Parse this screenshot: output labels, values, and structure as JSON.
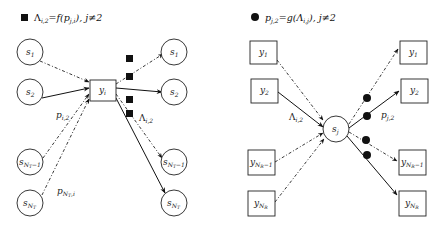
{
  "left_panel": {
    "legend": {
      "marker": "filled-square",
      "text": "Λ",
      "text_sub": "i,2",
      "text_rest": "=f(p",
      "text_sub2": "j,i",
      "text_tail": "), j≠2"
    },
    "center_node": {
      "label": "y",
      "sub": "i",
      "shape": "square"
    },
    "left_nodes": [
      {
        "label": "s",
        "sub": "1",
        "edge": "dash-dot"
      },
      {
        "label": "s",
        "sub": "2",
        "edge": "solid"
      },
      {
        "label": "s",
        "sub": "N",
        "sub2": "T",
        "sub3": "−1",
        "edge": "dash-dot"
      },
      {
        "label": "s",
        "sub": "N",
        "sub2": "T",
        "edge": "dash-dot"
      }
    ],
    "right_nodes": [
      {
        "label": "s",
        "sub": "1",
        "edge": "dash-dot"
      },
      {
        "label": "s",
        "sub": "2",
        "edge": "solid"
      },
      {
        "label": "s",
        "sub": "N",
        "sub2": "T",
        "sub3": "−1",
        "edge": "dash-dot"
      },
      {
        "label": "s",
        "sub": "N",
        "sub2": "T",
        "edge": "solid"
      }
    ],
    "edge_labels": {
      "in_top": {
        "main": "p",
        "sub": "i,2"
      },
      "in_bottom": {
        "main": "p",
        "sub": "N",
        "sub2": "T",
        "sub3": ",i"
      },
      "out": {
        "main": "Λ",
        "sub": "i,2"
      }
    }
  },
  "right_panel": {
    "legend": {
      "marker": "filled-circle",
      "text": "p",
      "text_sub": "j,2",
      "text_rest": "=g(Λ",
      "text_sub2": "i,j",
      "text_tail": "), j≠2"
    },
    "center_node": {
      "label": "s",
      "sub": "j",
      "shape": "circle"
    },
    "left_nodes": [
      {
        "label": "y",
        "sub": "1",
        "edge": "dash-dot"
      },
      {
        "label": "y",
        "sub": "2",
        "edge": "solid"
      },
      {
        "label": "y",
        "sub": "N",
        "sub2": "R",
        "sub3": "−1",
        "edge": "dash-dot"
      },
      {
        "label": "y",
        "sub": "N",
        "sub2": "R",
        "edge": "dash-dot"
      }
    ],
    "right_nodes": [
      {
        "label": "y",
        "sub": "1",
        "edge": "dash-dot"
      },
      {
        "label": "y",
        "sub": "2",
        "edge": "solid"
      },
      {
        "label": "y",
        "sub": "N",
        "sub2": "R",
        "sub3": "−1",
        "edge": "dash-dot"
      },
      {
        "label": "y",
        "sub": "N",
        "sub2": "R",
        "edge": "solid"
      }
    ],
    "edge_labels": {
      "in": {
        "main": "Λ",
        "sub": "i,2"
      },
      "out": {
        "main": "p",
        "sub": "j,2"
      }
    }
  }
}
